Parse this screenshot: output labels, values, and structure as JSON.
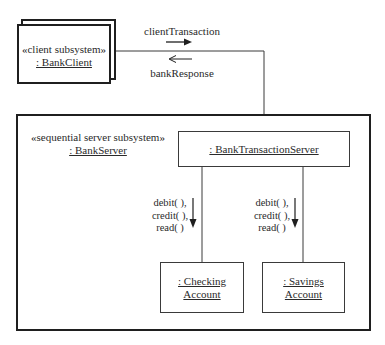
{
  "diagram": {
    "type": "UML communication diagram",
    "client": {
      "stereotype": "«client subsystem»",
      "name": ": BankClient",
      "multi_object": true
    },
    "messages": {
      "request": "clientTransaction",
      "response": "bankResponse"
    },
    "server": {
      "stereotype": "«sequential server subsystem»",
      "name": ": BankServer",
      "transaction_server": ": BankTransactionServer",
      "accounts": [
        {
          "name_line1": ": Checking",
          "name_line2": "Account",
          "ops": [
            "debit( ),",
            "credit( ),",
            "read( )"
          ]
        },
        {
          "name_line1": ": Savings",
          "name_line2": "Account",
          "ops": [
            "debit( ),",
            "credit( ),",
            "read( )"
          ]
        }
      ]
    },
    "colors": {
      "line": "#2a2a2a",
      "background": "#ffffff"
    }
  }
}
